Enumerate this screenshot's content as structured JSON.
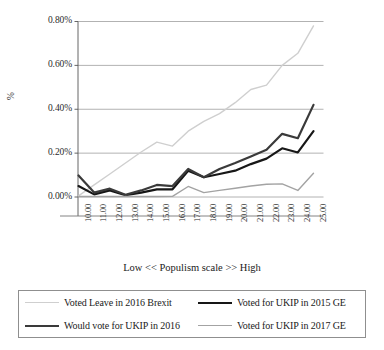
{
  "chart_data": {
    "type": "line",
    "title": "",
    "subtitle": "",
    "xlabel": "Low << Populism scale >> High",
    "ylabel": "%",
    "categories": [
      "10.00",
      "11.00",
      "12.00",
      "13.00",
      "14.00",
      "15.00",
      "16.00",
      "17.00",
      "18.00",
      "19.00",
      "20.00",
      "21.00",
      "22.00",
      "23.00",
      "24.00",
      "25.00"
    ],
    "x": [
      10,
      11,
      12,
      13,
      14,
      15,
      16,
      17,
      18,
      19,
      20,
      21,
      22,
      23,
      24,
      25
    ],
    "ylim": [
      0.0,
      0.8
    ],
    "yticks": [
      0.0,
      0.2,
      0.4,
      0.6,
      0.8
    ],
    "ytick_labels": [
      "0.00%",
      "0.20%",
      "0.40%",
      "0.60%",
      "0.80%"
    ],
    "grid": "horizontal",
    "legend_position": "bottom",
    "units": "percent",
    "series": [
      {
        "name": "Voted Leave in 2016 Brexit",
        "color": "#cfcfcf",
        "width": 1.4,
        "values": [
          0.005,
          0.055,
          0.105,
          0.155,
          0.205,
          0.25,
          0.232,
          0.3,
          0.345,
          0.38,
          0.43,
          0.49,
          0.51,
          0.6,
          0.655,
          0.78
        ]
      },
      {
        "name": "Voted for UKIP in 2015 GE",
        "color": "#171717",
        "width": 2.2,
        "values": [
          0.05,
          0.012,
          0.03,
          0.008,
          0.02,
          0.035,
          0.035,
          0.12,
          0.09,
          0.105,
          0.12,
          0.15,
          0.175,
          0.222,
          0.203,
          0.3
        ]
      },
      {
        "name": "Would vote for UKIP in 2016",
        "color": "#3a3a3a",
        "width": 2.2,
        "values": [
          0.098,
          0.02,
          0.038,
          0.01,
          0.03,
          0.055,
          0.05,
          0.128,
          0.09,
          0.128,
          0.155,
          0.185,
          0.215,
          0.288,
          0.268,
          0.42
        ]
      },
      {
        "name": "Voted for UKIP in 2017 GE",
        "color": "#a3a3a3",
        "width": 1.4,
        "values": [
          0.002,
          0.002,
          0.002,
          0.002,
          0.002,
          0.002,
          0.003,
          0.048,
          0.02,
          0.03,
          0.04,
          0.05,
          0.058,
          0.06,
          0.03,
          0.108
        ]
      }
    ]
  },
  "legend": {
    "entries": [
      {
        "label": "Voted Leave in 2016 Brexit",
        "color": "#cfcfcf",
        "width": 1.4
      },
      {
        "label": "Voted for UKIP in 2015 GE",
        "color": "#171717",
        "width": 2.4
      },
      {
        "label": "Would vote for UKIP in 2016",
        "color": "#3a3a3a",
        "width": 2.4
      },
      {
        "label": "Voted for UKIP in 2017 GE",
        "color": "#a3a3a3",
        "width": 1.4
      }
    ]
  },
  "axes": {
    "y_title": "%",
    "x_title": "Low << Populism scale >> High"
  }
}
